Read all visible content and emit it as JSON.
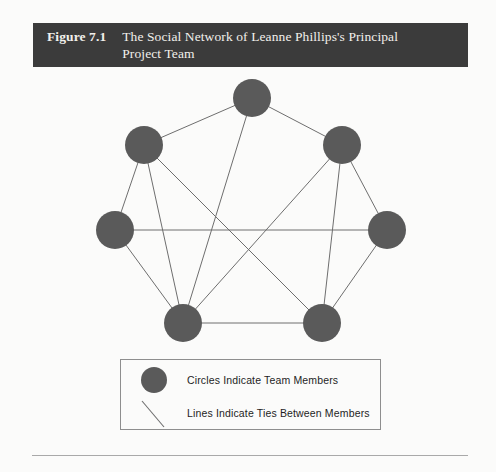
{
  "figure": {
    "number": "Figure 7.1",
    "caption": "The Social Network of Leanne Phillips's Principal Project Team",
    "title_bar_color": "#3b3b3b",
    "title_text_color": "#f2f0ec",
    "page_background": "#fbfbfa"
  },
  "diagram": {
    "node_color": "#5a5a5a",
    "edge_color": "#6e6e6e",
    "node_radius": 19,
    "nodes": [
      {
        "id": "top",
        "label": "",
        "x": 252,
        "y": 98
      },
      {
        "id": "upper-left",
        "label": "",
        "x": 144,
        "y": 145
      },
      {
        "id": "upper-right",
        "label": "",
        "x": 342,
        "y": 145
      },
      {
        "id": "mid-left",
        "label": "",
        "x": 115,
        "y": 230
      },
      {
        "id": "mid-right",
        "label": "",
        "x": 387,
        "y": 230
      },
      {
        "id": "bottom-left",
        "label": "",
        "x": 183,
        "y": 323
      },
      {
        "id": "bottom-right",
        "label": "",
        "x": 322,
        "y": 323
      }
    ],
    "edges": [
      {
        "from": "top",
        "to": "upper-left"
      },
      {
        "from": "top",
        "to": "upper-right"
      },
      {
        "from": "top",
        "to": "bottom-left"
      },
      {
        "from": "upper-left",
        "to": "mid-left"
      },
      {
        "from": "upper-left",
        "to": "bottom-left"
      },
      {
        "from": "upper-left",
        "to": "bottom-right"
      },
      {
        "from": "upper-right",
        "to": "mid-right"
      },
      {
        "from": "upper-right",
        "to": "bottom-right"
      },
      {
        "from": "upper-right",
        "to": "bottom-left"
      },
      {
        "from": "mid-left",
        "to": "mid-right"
      },
      {
        "from": "mid-left",
        "to": "bottom-left"
      },
      {
        "from": "mid-right",
        "to": "bottom-right"
      },
      {
        "from": "bottom-left",
        "to": "bottom-right"
      }
    ],
    "node_count": 7,
    "edge_count": 13
  },
  "legend": {
    "border_color": "#8e8e8e",
    "items": [
      {
        "symbol": "circle",
        "label": "Circles Indicate Team Members"
      },
      {
        "symbol": "line",
        "label": "Lines Indicate Ties Between Members"
      }
    ]
  },
  "footer": {
    "rule_color": "#a9a9a9"
  }
}
